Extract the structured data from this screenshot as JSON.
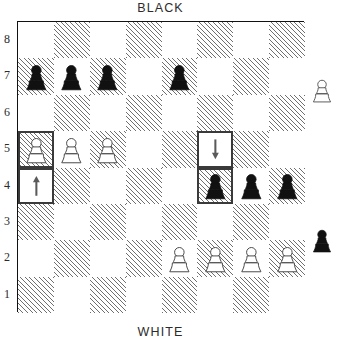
{
  "labels": {
    "top": "BLACK",
    "bottom": "WHITE"
  },
  "ranks": [
    "8",
    "7",
    "6",
    "5",
    "4",
    "3",
    "2",
    "1"
  ],
  "files": [
    "a",
    "b",
    "c",
    "d",
    "e",
    "f",
    "g",
    "h"
  ],
  "colors": {
    "dark_square_hatch": "#6f6f6f",
    "light_square": "#ffffff",
    "board_border": "#111111",
    "highlight_border": "#3a3a3a",
    "black_piece": "#111111",
    "white_piece_outline": "#444444",
    "arrow": "#5a5a5a",
    "text": "#2b2b2b"
  },
  "board": {
    "orientation": "white-bottom",
    "pieces": [
      {
        "square": "a7",
        "color": "black",
        "type": "pawn",
        "icon": "black-pawn-icon"
      },
      {
        "square": "b7",
        "color": "black",
        "type": "pawn",
        "icon": "black-pawn-icon"
      },
      {
        "square": "c7",
        "color": "black",
        "type": "pawn",
        "icon": "black-pawn-icon"
      },
      {
        "square": "e7",
        "color": "black",
        "type": "pawn",
        "icon": "black-pawn-icon"
      },
      {
        "square": "a5",
        "color": "white",
        "type": "pawn",
        "icon": "white-pawn-icon"
      },
      {
        "square": "b5",
        "color": "white",
        "type": "pawn",
        "icon": "white-pawn-icon"
      },
      {
        "square": "c5",
        "color": "white",
        "type": "pawn",
        "icon": "white-pawn-icon"
      },
      {
        "square": "f4",
        "color": "black",
        "type": "pawn",
        "icon": "black-pawn-icon"
      },
      {
        "square": "g4",
        "color": "black",
        "type": "pawn",
        "icon": "black-pawn-icon"
      },
      {
        "square": "h4",
        "color": "black",
        "type": "pawn",
        "icon": "black-pawn-icon"
      },
      {
        "square": "e2",
        "color": "white",
        "type": "pawn",
        "icon": "white-pawn-icon"
      },
      {
        "square": "f2",
        "color": "white",
        "type": "pawn",
        "icon": "white-pawn-icon"
      },
      {
        "square": "g2",
        "color": "white",
        "type": "pawn",
        "icon": "white-pawn-icon"
      },
      {
        "square": "h2",
        "color": "white",
        "type": "pawn",
        "icon": "white-pawn-icon"
      }
    ],
    "highlighted_squares": [
      "a5",
      "a4",
      "f5",
      "f4"
    ],
    "arrows": [
      {
        "square": "a4",
        "direction": "up",
        "icon": "arrow-up-icon"
      },
      {
        "square": "f5",
        "direction": "down",
        "icon": "arrow-down-icon"
      }
    ]
  },
  "offboard_pieces": [
    {
      "id": "offboard-white-pawn",
      "color": "white",
      "type": "pawn",
      "icon": "white-pawn-icon",
      "near_rank": "6"
    },
    {
      "id": "offboard-black-pawn",
      "color": "black",
      "type": "pawn",
      "icon": "black-pawn-icon",
      "near_rank": "2"
    }
  ]
}
